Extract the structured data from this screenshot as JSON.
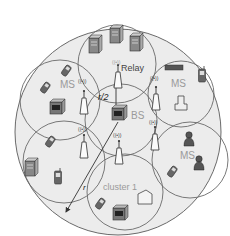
{
  "diagram": {
    "type": "cellular-relay-network",
    "labels": {
      "relay": "Relay",
      "bs": "BS",
      "ms_left": "MS",
      "ms_right_top": "MS",
      "ms_right_bottom": "MS",
      "cluster": "cluster 1",
      "half_radius": "r/2",
      "radius": "r",
      "signal": "((•))"
    },
    "colors": {
      "background": "#ffffff",
      "outer_fill": "#ececec",
      "cluster_fill": "#efefef",
      "stroke": "#6a6a6a",
      "label": "#9a9a9a",
      "dark_label": "#333333",
      "device": "#555555"
    },
    "clusters": [
      {
        "name": "relay-cluster",
        "label": "Relay"
      },
      {
        "name": "ms-left-cluster",
        "label": "MS"
      },
      {
        "name": "ms-right-top-cluster",
        "label": "MS"
      },
      {
        "name": "bs-center-cluster",
        "label": "BS"
      },
      {
        "name": "left-bottom-cluster",
        "label": ""
      },
      {
        "name": "ms-right-bottom-cluster",
        "label": "MS"
      },
      {
        "name": "cluster-1",
        "label": "cluster 1"
      }
    ]
  }
}
